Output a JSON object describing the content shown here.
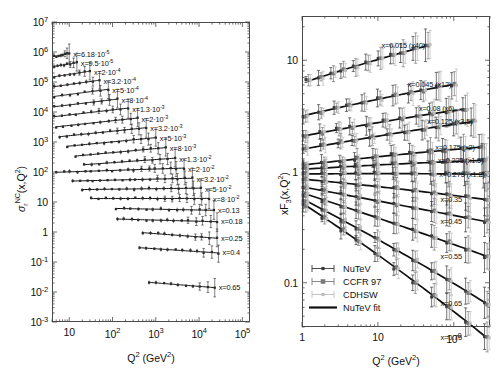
{
  "figure": {
    "title": "",
    "background": "#ffffff"
  },
  "chart_data": [
    {
      "id": "left-panel",
      "type": "scatter",
      "title": "",
      "xlabel": "Q2 (GeV2)",
      "ylabel": "sigma_r^NC(x,Q2)",
      "xscale": "log",
      "yscale": "log",
      "xlim": [
        4.0,
        150000.0
      ],
      "ylim": [
        0.001,
        10000000.0
      ],
      "grid": false,
      "legend_position": "none",
      "xticklabels": [
        "10",
        "10²",
        "10³",
        "10⁴",
        "10⁵"
      ],
      "xtickvalues": [
        10,
        100,
        1000,
        10000,
        100000
      ],
      "yticklabels": [
        "10⁻³",
        "10⁻²",
        "10⁻¹",
        "1",
        "10",
        "10²",
        "10³",
        "10⁴",
        "10⁵",
        "10⁶",
        "10⁷"
      ],
      "ytickvalues": [
        0.001,
        0.01,
        0.1,
        1,
        10,
        100,
        1000,
        10000,
        100000,
        1000000,
        10000000
      ],
      "series": [
        {
          "label": "x=6.18·10⁻⁵",
          "x_value": 6.18e-05,
          "q2_start": 4.5,
          "q2_end": 10,
          "y_start": 700000,
          "y_end": 900000
        },
        {
          "label": "x=9.5·10⁻⁵",
          "x_value": 9.5e-05,
          "q2_start": 4.5,
          "q2_end": 15,
          "y_start": 330000,
          "y_end": 440000
        },
        {
          "label": "x=2·10⁻⁴",
          "x_value": 0.0002,
          "q2_start": 4.5,
          "q2_end": 30,
          "y_start": 150000,
          "y_end": 230000
        },
        {
          "label": "x=3.2·10⁻⁴",
          "x_value": 0.00032,
          "q2_start": 4.5,
          "q2_end": 50,
          "y_start": 70000,
          "y_end": 115000
        },
        {
          "label": "x=5·10⁻⁴",
          "x_value": 0.0005,
          "q2_start": 4.5,
          "q2_end": 80,
          "y_start": 33000,
          "y_end": 57000
        },
        {
          "label": "x=8·10⁻⁴",
          "x_value": 0.0008,
          "q2_start": 4.5,
          "q2_end": 130,
          "y_start": 15000,
          "y_end": 27000
        },
        {
          "label": "x=1.3·10⁻³",
          "x_value": 0.0013,
          "q2_start": 4.5,
          "q2_end": 230,
          "y_start": 7000,
          "y_end": 13500
        },
        {
          "label": "x=2·10⁻³",
          "x_value": 0.002,
          "q2_start": 5.0,
          "q2_end": 380,
          "y_start": 3200,
          "y_end": 6300
        },
        {
          "label": "x=3.2·10⁻³",
          "x_value": 0.0032,
          "q2_start": 6.0,
          "q2_end": 600,
          "y_start": 1500,
          "y_end": 3000
        },
        {
          "label": "x=5·10⁻³",
          "x_value": 0.005,
          "q2_start": 9.0,
          "q2_end": 1000,
          "y_start": 720,
          "y_end": 1400
        },
        {
          "label": "x=8·10⁻³",
          "x_value": 0.008,
          "q2_start": 14.0,
          "q2_end": 1700,
          "y_start": 340,
          "y_end": 650
        },
        {
          "label": "x=1.3·10⁻²",
          "x_value": 0.013,
          "q2_start": 22.0,
          "q2_end": 2800,
          "y_start": 175,
          "y_end": 290
        },
        {
          "label": "x=2·10⁻²",
          "x_value": 0.02,
          "q2_start": 5.0,
          "q2_end": 4500,
          "y_start": 98,
          "y_end": 135
        },
        {
          "label": "x=3.2·10⁻²",
          "x_value": 0.032,
          "q2_start": 12.0,
          "q2_end": 7000,
          "y_start": 50,
          "y_end": 62
        },
        {
          "label": "x=5·10⁻²",
          "x_value": 0.05,
          "q2_start": 20.0,
          "q2_end": 11000,
          "y_start": 26,
          "y_end": 29
        },
        {
          "label": "x=8·10⁻²",
          "x_value": 0.08,
          "q2_start": 32.0,
          "q2_end": 17000,
          "y_start": 13,
          "y_end": 13.2
        },
        {
          "label": "x=0.13",
          "x_value": 0.13,
          "q2_start": 120,
          "q2_end": 22000,
          "y_start": 6.1,
          "y_end": 5.3
        },
        {
          "label": "x=0.18",
          "x_value": 0.18,
          "q2_start": 130,
          "q2_end": 26000,
          "y_start": 2.7,
          "y_end": 2.2
        },
        {
          "label": "x=0.25",
          "x_value": 0.25,
          "q2_start": 500,
          "q2_end": 26000,
          "y_start": 0.95,
          "y_end": 0.62
        },
        {
          "label": "x=0.4",
          "x_value": 0.4,
          "q2_start": 420,
          "q2_end": 28000,
          "y_start": 0.3,
          "y_end": 0.2
        },
        {
          "label": "x=0.65",
          "x_value": 0.65,
          "q2_start": 700,
          "q2_end": 23000,
          "y_start": 0.021,
          "y_end": 0.014
        }
      ]
    },
    {
      "id": "right-panel",
      "type": "scatter",
      "title": "",
      "xlabel": "Q2 (GeV2)",
      "ylabel": "xF3(x,Q2)",
      "xscale": "log",
      "yscale": "log",
      "xlim": [
        1.0,
        300.0
      ],
      "ylim": [
        0.04,
        25.0
      ],
      "grid": false,
      "legend_position": "lower-left",
      "xticklabels": [
        "1",
        "10",
        "100"
      ],
      "xtickvalues": [
        1,
        10,
        100
      ],
      "yticklabels": [
        "0.1",
        "1",
        "10"
      ],
      "ytickvalues": [
        0.1,
        1,
        10
      ],
      "legend": [
        {
          "label": "NuTeV",
          "marker": "dot-small",
          "color": "#3a3a3a"
        },
        {
          "label": "CCFR 97",
          "marker": "square-gray",
          "color": "#7a7a7a"
        },
        {
          "label": "CDHSW",
          "marker": "dot-light",
          "color": "#bdbdbd"
        },
        {
          "label": "NuTeV fit",
          "marker": "line",
          "color": "#111111"
        }
      ],
      "series": [
        {
          "label": "x=0.015 (x40)",
          "x_value": 0.015,
          "scale": 40,
          "q2_start": 1.2,
          "q2_end": 45,
          "y_start": 6.5,
          "y_end": 14.5
        },
        {
          "label": "x=0.045 (x12)",
          "x_value": 0.045,
          "scale": 12,
          "q2_start": 1.1,
          "q2_end": 100,
          "y_start": 3.2,
          "y_end": 6.5
        },
        {
          "label": "x=0.08 (x6)",
          "x_value": 0.08,
          "scale": 6,
          "q2_start": 1.1,
          "q2_end": 140,
          "y_start": 2.1,
          "y_end": 3.9
        },
        {
          "label": "x=0.125 (x3.5)",
          "x_value": 0.125,
          "scale": 3.5,
          "q2_start": 1.1,
          "q2_end": 180,
          "y_start": 1.6,
          "y_end": 3.0
        },
        {
          "label": "x=0.175 (x2)",
          "x_value": 0.175,
          "scale": 2,
          "q2_start": 1.1,
          "q2_end": 230,
          "y_start": 1.15,
          "y_end": 1.75
        },
        {
          "label": "x=0.225 (x1.5)",
          "x_value": 0.225,
          "scale": 1.5,
          "q2_start": 1.1,
          "q2_end": 250,
          "y_start": 1.05,
          "y_end": 1.32
        },
        {
          "label": "x=0.275 (x1.2)",
          "x_value": 0.275,
          "scale": 1.2,
          "q2_start": 1.1,
          "q2_end": 260,
          "y_start": 0.95,
          "y_end": 0.98
        },
        {
          "label": "x=0.35",
          "x_value": 0.35,
          "scale": 1,
          "q2_start": 1.1,
          "q2_end": 270,
          "y_start": 0.85,
          "y_end": 0.6
        },
        {
          "label": "x=0.45",
          "x_value": 0.45,
          "scale": 1,
          "q2_start": 1.1,
          "q2_end": 270,
          "y_start": 0.72,
          "y_end": 0.36
        },
        {
          "label": "x=0.55",
          "x_value": 0.55,
          "scale": 1,
          "q2_start": 1.1,
          "q2_end": 270,
          "y_start": 0.63,
          "y_end": 0.185
        },
        {
          "label": "x=0.65",
          "x_value": 0.65,
          "scale": 1,
          "q2_start": 1.1,
          "q2_end": 270,
          "y_start": 0.55,
          "y_end": 0.078
        },
        {
          "label": "x=0.75",
          "x_value": 0.75,
          "scale": 1,
          "q2_start": 1.1,
          "q2_end": 270,
          "y_start": 0.5,
          "y_end": 0.042
        }
      ]
    }
  ],
  "left": {
    "ylabel_main": "σ",
    "ylabel_sup": "NC",
    "ylabel_sub": "r",
    "ylabel_rest": "(x,Q²)",
    "xlabel_main": "Q",
    "xlabel_sup": "2",
    "xlabel_unit": " (GeV",
    "xlabel_unit_sup": "2",
    "xlabel_unit_end": ")"
  },
  "right": {
    "ylabel_main": "xF",
    "ylabel_sub": "3",
    "ylabel_rest": "(x,Q²)",
    "xlabel_main": "Q",
    "xlabel_sup": "2",
    "xlabel_unit": " (GeV",
    "xlabel_unit_sup": "2",
    "xlabel_unit_end": ")"
  },
  "colors": {
    "frame": "#4a4a4a",
    "curve": "#111111",
    "nutev": "#3a3a3a",
    "ccfr": "#7a7a7a",
    "cdhsw": "#bdbdbd",
    "text": "#111111"
  }
}
